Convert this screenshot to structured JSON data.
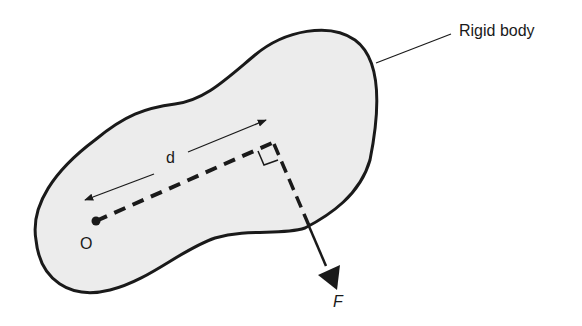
{
  "diagram": {
    "title_label": "Rigid body",
    "distance_label": "d",
    "pivot_label": "O",
    "force_label": "F",
    "colors": {
      "outline": "#1a1a1a",
      "body_fill": "#ececec",
      "background": "#ffffff"
    },
    "elements": [
      "rigid-body-outline",
      "leader-line",
      "pivot-point-O",
      "dashed-moment-arm",
      "distance-arrow-d",
      "right-angle-marker",
      "force-vector-F"
    ]
  }
}
